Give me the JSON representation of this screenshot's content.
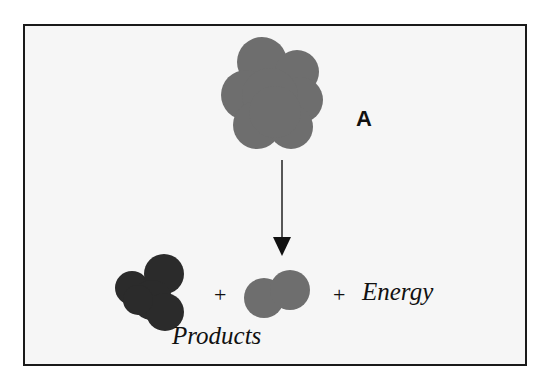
{
  "diagram": {
    "reactant": {
      "label": "A",
      "color": "#6e6e6e"
    },
    "arrow": {
      "direction": "down"
    },
    "products": {
      "label": "Products",
      "items": [
        {
          "name": "product-1",
          "color": "#2b2b2b"
        },
        {
          "name": "product-2",
          "color": "#6e6e6e"
        }
      ]
    },
    "plus_signs": [
      "+",
      "+"
    ],
    "energy_label": "Energy"
  }
}
